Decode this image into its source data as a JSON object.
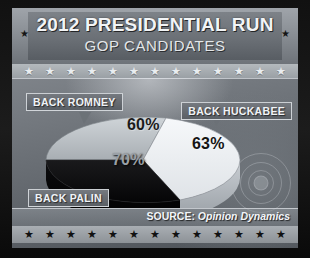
{
  "header": {
    "title": "2012 PRESIDENTIAL RUN",
    "subtitle": "GOP CANDIDATES",
    "left_star": "★",
    "right_star": "★"
  },
  "decor": {
    "star_glyph": "★",
    "top_star_count": 13,
    "bottom_star_count": 13
  },
  "labels": {
    "romney": "BACK ROMNEY",
    "huckabee": "BACK HUCKABEE",
    "palin": "BACK PALIN"
  },
  "footer": {
    "source_prefix": "SOURCE:",
    "source_name": "Opinion Dynamics"
  },
  "chart_data": {
    "type": "pie",
    "subtitle": "GOP CANDIDATES",
    "categories": [
      "BACK ROMNEY",
      "BACK HUCKABEE",
      "BACK PALIN"
    ],
    "values": [
      60,
      63,
      70
    ],
    "value_labels": [
      "60%",
      "63%",
      "70%"
    ],
    "colors": [
      "#b9bec3",
      "#eef1f4",
      "#0e0e10"
    ],
    "label_positions": [
      "top-left",
      "right",
      "bottom-left"
    ],
    "three_d": true,
    "legend": "callout-labels",
    "source": "SOURCE: Opinion Dynamics",
    "xlabel": "",
    "ylabel": ""
  },
  "palette": {
    "panel_bg": "#5d6166",
    "banner": "#7d8288",
    "title_text": "#f2f4f6",
    "slice_gray": "#b9bec3",
    "slice_white": "#eef1f4",
    "slice_black": "#0e0e10"
  }
}
